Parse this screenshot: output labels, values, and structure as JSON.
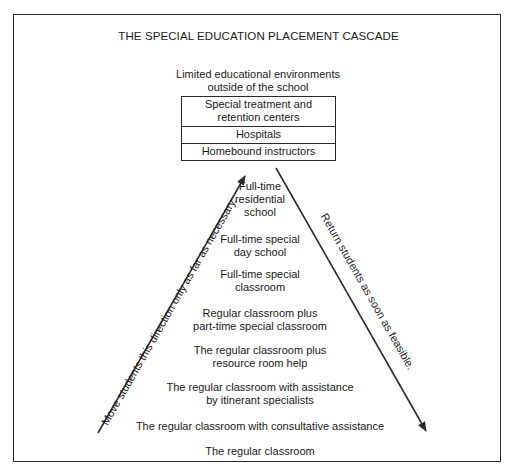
{
  "diagram": {
    "title": "THE SPECIAL EDUCATION PLACEMENT CASCADE",
    "top_heading": "Limited educational environments\noutside of the school",
    "outside_school_box": [
      "Special treatment and\nretention centers",
      "Hospitals",
      "Homebound instructors"
    ],
    "levels": [
      "Full-time\nresidential\nschool",
      "Full-time special\nday school",
      "Full-time special\nclassroom",
      "Regular classroom plus\npart-time special classroom",
      "The regular classroom plus\nresource room help",
      "The regular classroom with assistance\nby itinerant specialists",
      "The regular classroom with consultative assistance",
      "The regular classroom"
    ],
    "left_arrow_label": "Move students this direction only as far as necessary.",
    "right_arrow_label": "Return students as soon as feasible.",
    "colors": {
      "line": "#2a2a2a",
      "text": "#1a1a1a",
      "background": "#ffffff"
    }
  }
}
